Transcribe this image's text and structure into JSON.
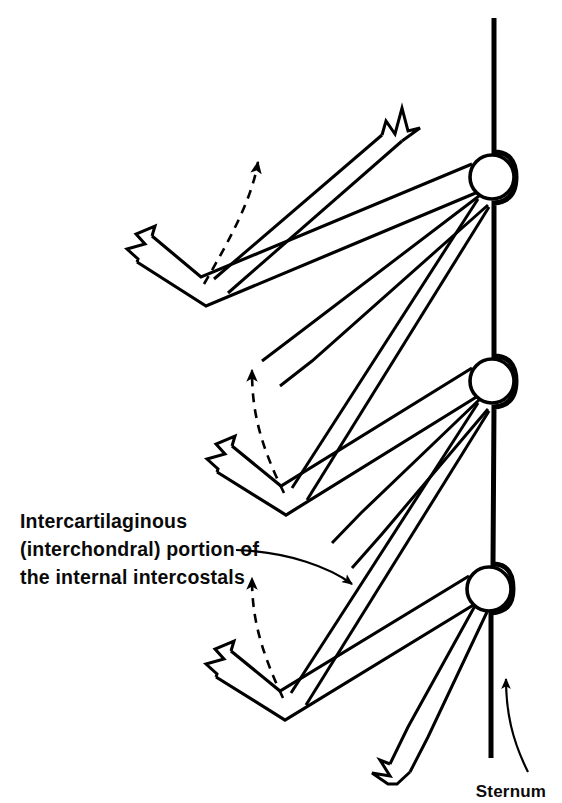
{
  "figure": {
    "title": "Intercartilaginous (interchondral) portion of the internal intercostals",
    "background_color": "#ffffff",
    "ink_color": "#000000",
    "width": 562,
    "height": 803
  },
  "labels": {
    "intercostal": {
      "name": "intercartilaginous-label",
      "line1": "Intercartilaginous",
      "line2": "(interchondral) portion of",
      "line3": "the internal intercostals"
    },
    "sternum": {
      "name": "sternum-label",
      "text": "Sternum"
    }
  },
  "structures": {
    "sternum": {
      "name": "sternum",
      "description": "vertical bar at right with bulges at each costal joint"
    },
    "joints": [
      {
        "name": "costochondral-joint-1",
        "cx": 492,
        "cy": 177,
        "r": 22
      },
      {
        "name": "costochondral-joint-2",
        "cx": 492,
        "cy": 381,
        "r": 22
      },
      {
        "name": "costochondral-joint-3",
        "cx": 489,
        "cy": 589,
        "r": 22
      }
    ],
    "ribs": [
      {
        "name": "rib-band-1",
        "vertex_x": 201,
        "vertex_y": 286
      },
      {
        "name": "rib-band-2",
        "vertex_x": 281,
        "vertex_y": 495
      },
      {
        "name": "rib-band-3",
        "vertex_x": 280,
        "vertex_y": 700
      }
    ],
    "muscles": [
      {
        "name": "intercostal-muscle-band-1"
      },
      {
        "name": "intercostal-muscle-band-2"
      },
      {
        "name": "intercostal-muscle-band-3"
      }
    ],
    "motion_arrows": [
      {
        "name": "motion-arrow-1",
        "direction": "up"
      },
      {
        "name": "motion-arrow-2",
        "direction": "up"
      },
      {
        "name": "motion-arrow-3",
        "direction": "up"
      }
    ]
  }
}
